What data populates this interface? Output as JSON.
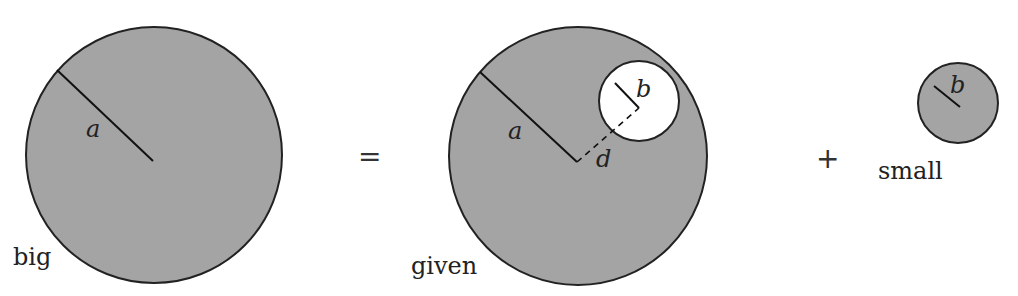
{
  "diagram": {
    "colors": {
      "fill": "#a4a4a4",
      "stroke": "#222222",
      "hole": "#ffffff",
      "background": "#ffffff"
    },
    "big": {
      "label": "big",
      "radius_label": "a"
    },
    "equals": "=",
    "given": {
      "label": "given",
      "radius_label": "a",
      "hole_radius_label": "b",
      "offset_label": "d"
    },
    "plus": "+",
    "small": {
      "label": "small",
      "radius_label": "b"
    }
  }
}
